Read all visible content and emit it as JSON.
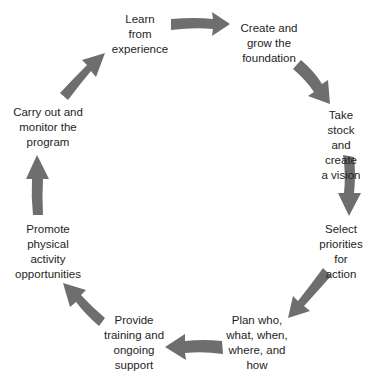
{
  "diagram": {
    "type": "cycle",
    "arrow_color": "#6e6e6e",
    "text_color": "#1e1e1e",
    "steps": [
      {
        "label": "Learn\nfrom\nexperience"
      },
      {
        "label": "Create and\ngrow the\nfoundation"
      },
      {
        "label": "Take stock\nand create\na vision"
      },
      {
        "label": "Select\npriorities\nfor action"
      },
      {
        "label": "Plan who,\nwhat, when,\nwhere, and\nhow"
      },
      {
        "label": "Provide\ntraining and\nongoing\nsupport"
      },
      {
        "label": "Promote\nphysical\nactivity\nopportunities"
      },
      {
        "label": "Carry out and\nmonitor the\nprogram"
      }
    ],
    "arrows": [
      {
        "from": "Learn from experience",
        "to": "Create and grow the foundation",
        "direction": "right"
      },
      {
        "from": "Create and grow the foundation",
        "to": "Take stock and create a vision",
        "direction": "down-right"
      },
      {
        "from": "Take stock and create a vision",
        "to": "Select priorities for action",
        "direction": "down"
      },
      {
        "from": "Select priorities for action",
        "to": "Plan who, what, when, where, and how",
        "direction": "down-left"
      },
      {
        "from": "Plan who, what, when, where, and how",
        "to": "Provide training and ongoing support",
        "direction": "left"
      },
      {
        "from": "Provide training and ongoing support",
        "to": "Promote physical activity opportunities",
        "direction": "up-left"
      },
      {
        "from": "Promote physical activity opportunities",
        "to": "Carry out and monitor the program",
        "direction": "up"
      },
      {
        "from": "Carry out and monitor the program",
        "to": "Learn from experience",
        "direction": "up-right"
      }
    ]
  }
}
